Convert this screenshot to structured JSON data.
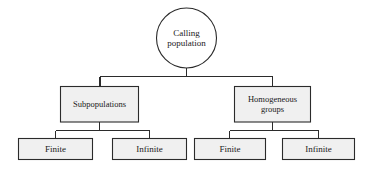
{
  "diagram": {
    "type": "tree",
    "orientation": "top-down",
    "background_color": "#ffffff",
    "stroke_color": "#2b2b2b",
    "box_fill_color": "#f0f0f0",
    "ellipse_fill_color": "#ffffff",
    "text_color": "#1a1a1a",
    "root": {
      "shape": "ellipse",
      "label": "Calling\npopulation",
      "line1": "Calling",
      "line2": "population"
    },
    "branches": [
      {
        "shape": "rectangle",
        "label": "Subpopulations",
        "children": [
          {
            "shape": "rectangle",
            "label": "Finite"
          },
          {
            "shape": "rectangle",
            "label": "Infinite"
          }
        ]
      },
      {
        "shape": "rectangle",
        "label": "Homogeneous\ngroups",
        "line1": "Homogeneous",
        "line2": "groups",
        "children": [
          {
            "shape": "rectangle",
            "label": "Finite"
          },
          {
            "shape": "rectangle",
            "label": "Infinite"
          }
        ]
      }
    ]
  }
}
